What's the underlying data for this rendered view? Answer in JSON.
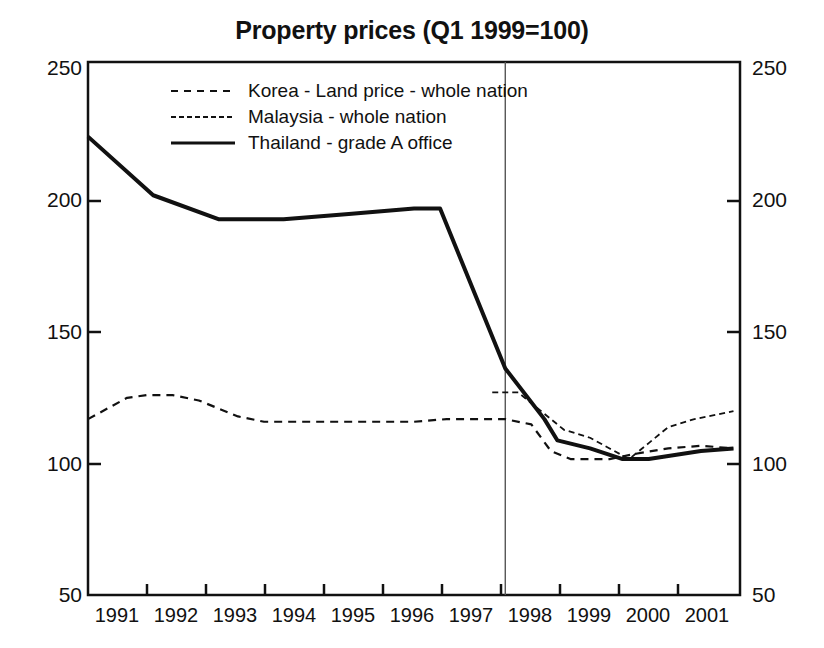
{
  "chart_data": {
    "type": "line",
    "title": "Property prices (Q1 1999=100)",
    "xlabel": "",
    "ylabel": "",
    "xlim": [
      1991,
      2001
    ],
    "ylim": [
      50,
      250
    ],
    "yticks": [
      50,
      100,
      150,
      200,
      250
    ],
    "xticks": [
      1991,
      1992,
      1993,
      1994,
      1995,
      1996,
      1997,
      1998,
      1999,
      2000,
      2001
    ],
    "grid": false,
    "legend_position": "upper-left-inside",
    "dual_y_axis": true,
    "annotations": [
      {
        "type": "vertical-line",
        "x": 1997.4,
        "label": ""
      }
    ],
    "series": [
      {
        "name": "Korea - Land price - whole nation",
        "style": "dashed",
        "points": [
          {
            "x": 1991.0,
            "y": 116
          },
          {
            "x": 1991.3,
            "y": 120
          },
          {
            "x": 1991.6,
            "y": 124
          },
          {
            "x": 1991.9,
            "y": 125
          },
          {
            "x": 1992.3,
            "y": 125
          },
          {
            "x": 1992.7,
            "y": 123
          },
          {
            "x": 1993.0,
            "y": 120
          },
          {
            "x": 1993.3,
            "y": 117
          },
          {
            "x": 1993.7,
            "y": 115
          },
          {
            "x": 1994.2,
            "y": 115
          },
          {
            "x": 1995.0,
            "y": 115
          },
          {
            "x": 1996.0,
            "y": 115
          },
          {
            "x": 1996.5,
            "y": 116
          },
          {
            "x": 1997.0,
            "y": 116
          },
          {
            "x": 1997.4,
            "y": 116
          },
          {
            "x": 1997.8,
            "y": 114
          },
          {
            "x": 1998.1,
            "y": 104
          },
          {
            "x": 1998.4,
            "y": 101
          },
          {
            "x": 1999.0,
            "y": 101
          },
          {
            "x": 1999.4,
            "y": 103
          },
          {
            "x": 1999.9,
            "y": 105
          },
          {
            "x": 2000.4,
            "y": 106
          },
          {
            "x": 2000.9,
            "y": 105
          }
        ]
      },
      {
        "name": "Malaysia - whole nation",
        "style": "dashed-fine",
        "points": [
          {
            "x": 1997.2,
            "y": 126
          },
          {
            "x": 1997.6,
            "y": 126
          },
          {
            "x": 1998.0,
            "y": 118
          },
          {
            "x": 1998.3,
            "y": 112
          },
          {
            "x": 1998.7,
            "y": 109
          },
          {
            "x": 1999.0,
            "y": 105
          },
          {
            "x": 1999.3,
            "y": 101
          },
          {
            "x": 1999.6,
            "y": 107
          },
          {
            "x": 1999.9,
            "y": 113
          },
          {
            "x": 2000.3,
            "y": 116
          },
          {
            "x": 2000.7,
            "y": 118
          },
          {
            "x": 2000.9,
            "y": 119
          }
        ]
      },
      {
        "name": "Thailand - grade A office",
        "style": "solid",
        "points": [
          {
            "x": 1991.0,
            "y": 222
          },
          {
            "x": 1992.0,
            "y": 200
          },
          {
            "x": 1993.0,
            "y": 191
          },
          {
            "x": 1994.0,
            "y": 191
          },
          {
            "x": 1995.0,
            "y": 193
          },
          {
            "x": 1996.0,
            "y": 195
          },
          {
            "x": 1996.4,
            "y": 195
          },
          {
            "x": 1997.4,
            "y": 135
          },
          {
            "x": 1998.0,
            "y": 116
          },
          {
            "x": 1998.2,
            "y": 108
          },
          {
            "x": 1998.7,
            "y": 105
          },
          {
            "x": 1999.2,
            "y": 101
          },
          {
            "x": 1999.6,
            "y": 101
          },
          {
            "x": 2000.4,
            "y": 104
          },
          {
            "x": 2000.9,
            "y": 105
          }
        ]
      }
    ],
    "legend": [
      {
        "label": "Korea - Land price - whole nation",
        "style": "dashed"
      },
      {
        "label": "Malaysia - whole nation",
        "style": "dashed-fine"
      },
      {
        "label": "Thailand - grade A office",
        "style": "solid"
      }
    ],
    "axis_left_ticks": [
      "250",
      "200",
      "150",
      "100",
      "50"
    ],
    "axis_right_ticks": [
      "250",
      "200",
      "150",
      "100",
      "50"
    ],
    "axis_x_ticks": [
      "1991",
      "1992",
      "1993",
      "1994",
      "1995",
      "1996",
      "1997",
      "1998",
      "1999",
      "2000",
      "2001"
    ],
    "colors": {
      "line": "#111111",
      "axis": "#111111",
      "reference_line": "#555555",
      "background": "#ffffff"
    }
  }
}
